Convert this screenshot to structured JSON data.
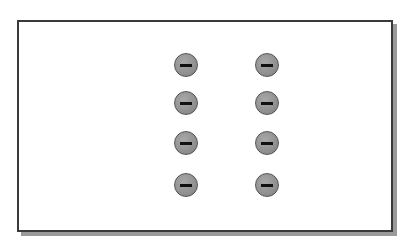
{
  "diagram": {
    "frame": {
      "border_color": "#3a3a3a",
      "shadow_color": "#9a9a9a",
      "background": "#ffffff"
    },
    "charges": [
      {
        "sign": "negative",
        "icon": "minus-icon",
        "x": 186,
        "y": 65
      },
      {
        "sign": "negative",
        "icon": "minus-icon",
        "x": 186,
        "y": 103
      },
      {
        "sign": "negative",
        "icon": "minus-icon",
        "x": 186,
        "y": 143
      },
      {
        "sign": "negative",
        "icon": "minus-icon",
        "x": 186,
        "y": 185
      },
      {
        "sign": "negative",
        "icon": "minus-icon",
        "x": 267,
        "y": 65
      },
      {
        "sign": "negative",
        "icon": "minus-icon",
        "x": 267,
        "y": 103
      },
      {
        "sign": "negative",
        "icon": "minus-icon",
        "x": 267,
        "y": 143
      },
      {
        "sign": "negative",
        "icon": "minus-icon",
        "x": 267,
        "y": 185
      }
    ],
    "charge_color": "#8c8c8c"
  }
}
